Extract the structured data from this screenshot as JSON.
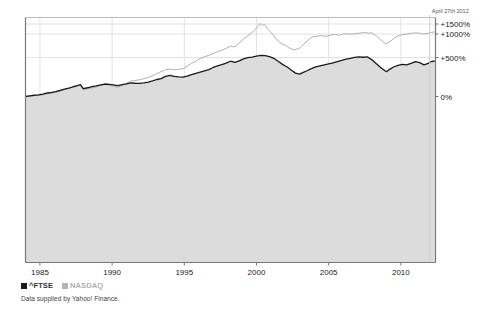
{
  "chart_data": {
    "type": "line",
    "title": "",
    "subtitle": "",
    "xlabel": "",
    "ylabel": "",
    "grid": true,
    "legend_position": "below-left",
    "annotation": "April 27th 2012",
    "source_note": "Data supplied by Yahoo! Finance.",
    "x_tick_labels": [
      "1985",
      "1990",
      "1995",
      "2000",
      "2005",
      "2010"
    ],
    "x_tick_values": [
      1985,
      1990,
      1995,
      2000,
      2005,
      2010
    ],
    "xlim": [
      1984.0,
      2012.4
    ],
    "y_tick_labels": [
      "0%",
      "+500%",
      "+1000%",
      "+1500%"
    ],
    "y_tick_values": [
      0,
      500,
      1000,
      1500
    ],
    "ylim": [
      -100,
      1750
    ],
    "y_scale": "log-like",
    "colors": {
      "ftse_line": "#1a1a1a",
      "ftse_fill": "#dcdcdc",
      "nasdaq_line": "#a8a8a8",
      "axis": "#888888",
      "grid": "#e2e2e2",
      "text": "#222222",
      "background": "#ffffff"
    },
    "series": [
      {
        "name": "^FTSE",
        "color": "#1a1a1a",
        "filled": true,
        "x": [
          1984.0,
          1984.3,
          1984.6,
          1984.9,
          1985.2,
          1985.5,
          1985.8,
          1986.1,
          1986.4,
          1986.7,
          1987.0,
          1987.3,
          1987.6,
          1987.8,
          1988.0,
          1988.3,
          1988.6,
          1988.9,
          1989.2,
          1989.5,
          1989.8,
          1990.1,
          1990.4,
          1990.7,
          1991.0,
          1991.3,
          1991.6,
          1991.9,
          1992.2,
          1992.5,
          1992.8,
          1993.1,
          1993.4,
          1993.7,
          1994.0,
          1994.3,
          1994.6,
          1994.9,
          1995.2,
          1995.5,
          1995.8,
          1996.1,
          1996.4,
          1996.7,
          1997.0,
          1997.3,
          1997.6,
          1997.9,
          1998.2,
          1998.5,
          1998.8,
          1999.1,
          1999.4,
          1999.7,
          2000.0,
          2000.3,
          2000.6,
          2000.9,
          2001.2,
          2001.5,
          2001.8,
          2002.1,
          2002.4,
          2002.7,
          2003.0,
          2003.2,
          2003.5,
          2003.8,
          2004.1,
          2004.4,
          2004.7,
          2005.0,
          2005.3,
          2005.6,
          2005.9,
          2006.2,
          2006.5,
          2006.8,
          2007.1,
          2007.4,
          2007.7,
          2008.0,
          2008.3,
          2008.6,
          2008.9,
          2009.0,
          2009.2,
          2009.5,
          2009.8,
          2010.1,
          2010.4,
          2010.7,
          2011.0,
          2011.3,
          2011.6,
          2011.9,
          2012.1,
          2012.35
        ],
        "y": [
          0,
          8,
          16,
          22,
          30,
          45,
          52,
          62,
          78,
          95,
          108,
          125,
          140,
          152,
          100,
          112,
          128,
          135,
          150,
          160,
          155,
          148,
          140,
          152,
          162,
          175,
          170,
          168,
          175,
          185,
          200,
          218,
          230,
          258,
          272,
          258,
          252,
          248,
          262,
          280,
          296,
          312,
          328,
          345,
          372,
          392,
          408,
          428,
          452,
          438,
          458,
          482,
          498,
          510,
          530,
          545,
          538,
          520,
          490,
          452,
          412,
          382,
          340,
          300,
          288,
          305,
          330,
          358,
          380,
          392,
          405,
          418,
          432,
          448,
          462,
          478,
          488,
          502,
          515,
          505,
          512,
          470,
          420,
          372,
          330,
          318,
          345,
          378,
          400,
          412,
          405,
          425,
          448,
          435,
          405,
          425,
          448,
          455
        ]
      },
      {
        "name": "NASDAQ",
        "color": "#a8a8a8",
        "filled": false,
        "x": [
          1984.0,
          1984.3,
          1984.6,
          1984.9,
          1985.2,
          1985.5,
          1985.8,
          1986.1,
          1986.4,
          1986.7,
          1987.0,
          1987.3,
          1987.6,
          1987.8,
          1988.0,
          1988.3,
          1988.6,
          1988.9,
          1989.2,
          1989.5,
          1989.8,
          1990.1,
          1990.4,
          1990.7,
          1991.0,
          1991.3,
          1991.6,
          1991.9,
          1992.2,
          1992.5,
          1992.8,
          1993.1,
          1993.4,
          1993.7,
          1994.0,
          1994.3,
          1994.6,
          1994.9,
          1995.2,
          1995.5,
          1995.8,
          1996.1,
          1996.4,
          1996.7,
          1997.0,
          1997.3,
          1997.6,
          1997.9,
          1998.2,
          1998.5,
          1998.8,
          1999.1,
          1999.4,
          1999.7,
          1999.9,
          2000.1,
          2000.25,
          2000.4,
          2000.55,
          2000.7,
          2000.9,
          2001.1,
          2001.4,
          2001.7,
          2002.0,
          2002.3,
          2002.6,
          2002.9,
          2003.0,
          2003.3,
          2003.6,
          2003.9,
          2004.2,
          2004.5,
          2004.8,
          2005.1,
          2005.4,
          2005.7,
          2006.0,
          2006.3,
          2006.6,
          2006.9,
          2007.2,
          2007.5,
          2007.8,
          2008.0,
          2008.3,
          2008.6,
          2008.9,
          2009.0,
          2009.2,
          2009.5,
          2009.8,
          2010.1,
          2010.4,
          2010.7,
          2011.0,
          2011.3,
          2011.6,
          2011.9,
          2012.1,
          2012.35
        ],
        "y": [
          0,
          5,
          10,
          14,
          20,
          32,
          40,
          52,
          68,
          86,
          102,
          122,
          138,
          148,
          85,
          98,
          112,
          120,
          138,
          152,
          145,
          130,
          120,
          140,
          170,
          198,
          205,
          215,
          228,
          245,
          265,
          295,
          318,
          345,
          352,
          342,
          348,
          356,
          390,
          425,
          452,
          488,
          515,
          548,
          585,
          625,
          655,
          695,
          742,
          728,
          810,
          895,
          960,
          1080,
          1210,
          1380,
          1520,
          1430,
          1480,
          1300,
          1150,
          1020,
          880,
          800,
          760,
          700,
          660,
          690,
          700,
          790,
          880,
          940,
          955,
          965,
          950,
          975,
          990,
          975,
          1000,
          1010,
          995,
          1020,
          1050,
          1070,
          1045,
          1050,
          960,
          880,
          800,
          790,
          830,
          900,
          960,
          985,
          1000,
          1030,
          1060,
          1040,
          1000,
          1040,
          1080,
          1105
        ]
      }
    ]
  },
  "legend": {
    "items": [
      {
        "label": "^FTSE",
        "color": "#1a1a1a"
      },
      {
        "label": "NASDAQ",
        "color": "#b4b4b4"
      }
    ]
  },
  "caption": {
    "text": "Data supplied by Yahoo! Finance."
  },
  "annotation": {
    "text": "April 27th 2012"
  },
  "axes": {
    "y_ticks": [
      {
        "label": "+1500%"
      },
      {
        "label": "+1000%"
      },
      {
        "label": "+500%"
      },
      {
        "label": "0%"
      }
    ],
    "x_ticks": [
      {
        "label": "1985"
      },
      {
        "label": "1990"
      },
      {
        "label": "1995"
      },
      {
        "label": "2000"
      },
      {
        "label": "2005"
      },
      {
        "label": "2010"
      }
    ]
  }
}
